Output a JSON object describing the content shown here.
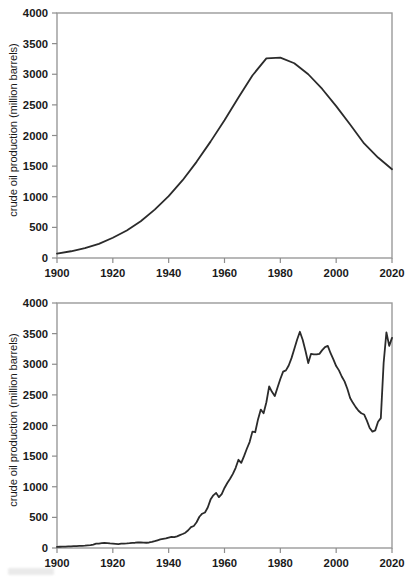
{
  "page": {
    "background_color": "#ffffff",
    "line_color": "#2b2b2b",
    "frame_color": "#9a9a9a"
  },
  "figures": [
    {
      "id": "top",
      "ylabel": "crude oil production (million barrels)",
      "xlabel": "",
      "y_ticks": [
        "0",
        "500",
        "1000",
        "1500",
        "2000",
        "2500",
        "3000",
        "3500",
        "4000"
      ],
      "x_ticks": [
        "1900",
        "1920",
        "1940",
        "1960",
        "1980",
        "2000",
        "2020"
      ]
    },
    {
      "id": "bottom",
      "ylabel": "crude oil production (million barrels)",
      "xlabel": "",
      "y_ticks": [
        "0",
        "500",
        "1000",
        "1500",
        "2000",
        "2500",
        "3000",
        "3500",
        "4000"
      ],
      "x_ticks": [
        "1900",
        "1920",
        "1940",
        "1960",
        "1980",
        "2000",
        "2020"
      ]
    }
  ],
  "chart_data": [
    {
      "type": "line",
      "title": "",
      "xlabel": "",
      "ylabel": "crude oil production (million barrels)",
      "xlim": [
        1900,
        2020
      ],
      "ylim": [
        0,
        4000
      ],
      "xticks": [
        1900,
        1920,
        1940,
        1960,
        1980,
        2000,
        2020
      ],
      "yticks": [
        0,
        500,
        1000,
        1500,
        2000,
        2500,
        3000,
        3500,
        4000
      ],
      "grid": false,
      "legend": null,
      "series": [
        {
          "name": "Hubbert curve (idealized)",
          "x": [
            1900,
            1905,
            1910,
            1915,
            1920,
            1925,
            1930,
            1935,
            1940,
            1945,
            1950,
            1955,
            1960,
            1965,
            1970,
            1975,
            1980,
            1985,
            1990,
            1995,
            2000,
            2005,
            2010,
            2015,
            2020
          ],
          "values": [
            70,
            110,
            160,
            230,
            330,
            450,
            600,
            790,
            1010,
            1270,
            1570,
            1900,
            2250,
            2620,
            2980,
            3260,
            3270,
            3180,
            3000,
            2760,
            2480,
            2180,
            1870,
            1640,
            1450
          ]
        }
      ]
    },
    {
      "type": "line",
      "title": "",
      "xlabel": "",
      "ylabel": "crude oil production (million barrels)",
      "xlim": [
        1900,
        2020
      ],
      "ylim": [
        0,
        4000
      ],
      "xticks": [
        1900,
        1920,
        1940,
        1960,
        1980,
        2000,
        2020
      ],
      "yticks": [
        0,
        500,
        1000,
        1500,
        2000,
        2500,
        3000,
        3500,
        4000
      ],
      "grid": false,
      "legend": null,
      "series": [
        {
          "name": "Actual annual production",
          "x": [
            1900,
            1901,
            1902,
            1903,
            1904,
            1905,
            1906,
            1907,
            1908,
            1909,
            1910,
            1911,
            1912,
            1913,
            1914,
            1915,
            1916,
            1917,
            1918,
            1919,
            1920,
            1921,
            1922,
            1923,
            1924,
            1925,
            1926,
            1927,
            1928,
            1929,
            1930,
            1931,
            1932,
            1933,
            1934,
            1935,
            1936,
            1937,
            1938,
            1939,
            1940,
            1941,
            1942,
            1943,
            1944,
            1945,
            1946,
            1947,
            1948,
            1949,
            1950,
            1951,
            1952,
            1953,
            1954,
            1955,
            1956,
            1957,
            1958,
            1959,
            1960,
            1961,
            1962,
            1963,
            1964,
            1965,
            1966,
            1967,
            1968,
            1969,
            1970,
            1971,
            1972,
            1973,
            1974,
            1975,
            1976,
            1977,
            1978,
            1979,
            1980,
            1981,
            1982,
            1983,
            1984,
            1985,
            1986,
            1987,
            1988,
            1989,
            1990,
            1991,
            1992,
            1993,
            1994,
            1995,
            1996,
            1997,
            1998,
            1999,
            2000,
            2001,
            2002,
            2003,
            2004,
            2005,
            2006,
            2007,
            2008,
            2009,
            2010,
            2011,
            2012,
            2013,
            2014,
            2015,
            2016,
            2017,
            2018,
            2019,
            2020
          ],
          "values": [
            18,
            20,
            22,
            24,
            26,
            28,
            30,
            32,
            34,
            36,
            38,
            42,
            46,
            55,
            70,
            72,
            78,
            82,
            80,
            74,
            70,
            66,
            62,
            70,
            72,
            74,
            78,
            84,
            86,
            92,
            90,
            88,
            86,
            90,
            100,
            112,
            126,
            140,
            148,
            156,
            170,
            182,
            178,
            190,
            210,
            228,
            250,
            290,
            340,
            360,
            420,
            510,
            560,
            580,
            660,
            790,
            860,
            900,
            830,
            880,
            980,
            1060,
            1130,
            1210,
            1310,
            1440,
            1390,
            1500,
            1620,
            1730,
            1900,
            1890,
            2100,
            2260,
            2200,
            2380,
            2640,
            2550,
            2480,
            2620,
            2760,
            2880,
            2900,
            2980,
            3100,
            3250,
            3400,
            3530,
            3400,
            3220,
            3020,
            3170,
            3160,
            3160,
            3170,
            3230,
            3280,
            3300,
            3180,
            3080,
            2970,
            2900,
            2800,
            2720,
            2600,
            2450,
            2370,
            2300,
            2240,
            2200,
            2180,
            2080,
            1960,
            1900,
            1920,
            2060,
            2120,
            3020,
            3520,
            3300,
            3430
          ]
        }
      ]
    }
  ]
}
